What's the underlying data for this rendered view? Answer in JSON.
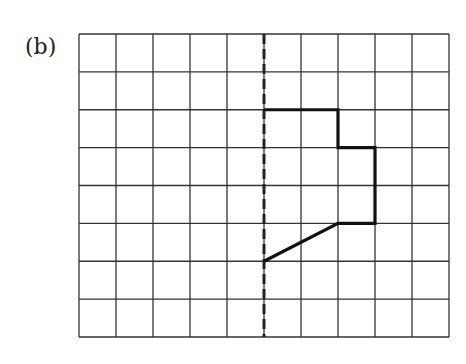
{
  "figure": {
    "label": "(b)",
    "grid": {
      "columns": 10,
      "rows": 8,
      "left": 79,
      "top": 34,
      "right": 449,
      "bottom": 337,
      "line_color": "#333333"
    },
    "mirror_line": {
      "style": "dashed",
      "column_index": 5
    },
    "shape": {
      "description": "half-figure drawn to the right of the dashed mirror line",
      "points": [
        [
          5,
          2
        ],
        [
          7,
          2
        ],
        [
          7,
          3
        ],
        [
          8,
          3
        ],
        [
          8,
          5
        ],
        [
          7,
          5
        ],
        [
          5,
          6
        ]
      ],
      "stroke_color": "#111111"
    }
  }
}
